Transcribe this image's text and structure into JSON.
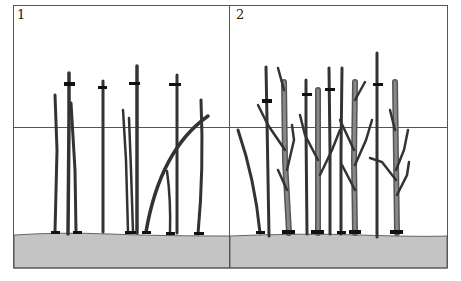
{
  "panels": [
    {
      "label": "1",
      "description": "Unpruned planting: thin stems with cut marks"
    },
    {
      "label": "2",
      "description": "Later year: thicker branched stems with cut marks"
    }
  ],
  "colors": {
    "ground": "#c4c4c4",
    "stem_outline": "#333333",
    "stem_fill": "#7a7a7a",
    "frame": "#555555",
    "background": "#ffffff"
  }
}
